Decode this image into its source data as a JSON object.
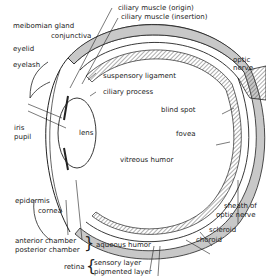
{
  "diagram": {
    "labels": {
      "ciliary_muscle_origin": "ciliary muscle (origin)",
      "ciliary_muscle_insertion": "ciliary muscle (insertion)",
      "meibomian_gland": "meibomian gland",
      "conjunctiva": "conjunctiva",
      "eyelid": "eyelid",
      "eyelash": "eyelash",
      "suspensory_ligament": "suspensory ligament",
      "ciliary_process": "ciliary process",
      "optic_nerve_1": "optic",
      "optic_nerve_2": "nerve",
      "iris": "iris",
      "pupil": "pupil",
      "lens": "lens",
      "blind_spot": "blind spot",
      "fovea": "fovea",
      "vitreous_humor": "vitreous humor",
      "epidermis": "epidermis",
      "cornea": "cornea",
      "sheath_1": "sheath of",
      "sheath_2": "optic nerve",
      "scleroid": "scleroid",
      "choroid": "choroid",
      "anterior_chamber": "anterior chamber",
      "posterior_chamber": "posterior chamber",
      "aqueous_humor": "aqueous humor",
      "retina": "retina",
      "sensory_layer": "sensory layer",
      "pigmented_layer": "pigmented layer"
    },
    "colors": {
      "line": "#222222",
      "fill_gray": "#c8c8c8",
      "background": "#ffffff"
    }
  }
}
